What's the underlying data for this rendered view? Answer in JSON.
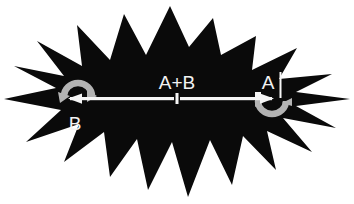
{
  "figure": {
    "background_color": "#ffffff",
    "burst_color": "#0a0a0a",
    "line_color": "#f5f5f5",
    "arrow_color": "#b3b3b3",
    "label_color": "#f2f2f2",
    "width": 354,
    "height": 204
  },
  "labels": {
    "left": "B",
    "center": "A+B",
    "right": "A"
  },
  "icons": {
    "left_rotation": "curved-arrow-icon",
    "right_rotation": "curved-arrow-icon",
    "left_head": "arrowhead-left-icon",
    "right_head": "arrowhead-right-icon",
    "burst": "starburst-shape",
    "center_tick": "midpoint-tick",
    "right_tick": "endpoint-tick"
  },
  "geometry": {
    "axis_y": 99,
    "left_end_x": 62,
    "center_x": 177,
    "right_end_x": 272,
    "burst_points": "170,6 189,47 213,18 221,55 256,36 252,70 297,48 279,79 332,74 296,92 350,99 296,106 336,128 283,118 312,152 267,131 276,170 243,136 232,185 210,140 188,197 172,142 148,190 137,139 110,177 104,132 64,162 79,124 26,142 61,110 4,99 56,88 14,66 64,76 37,41 82,66 77,25 110,60 124,14 146,55",
    "left_arc": "M 64,96 A 14,13 0 1 1 92,96",
    "right_arc": "M 258,101 A 14,13 0 1 0 286,101"
  }
}
